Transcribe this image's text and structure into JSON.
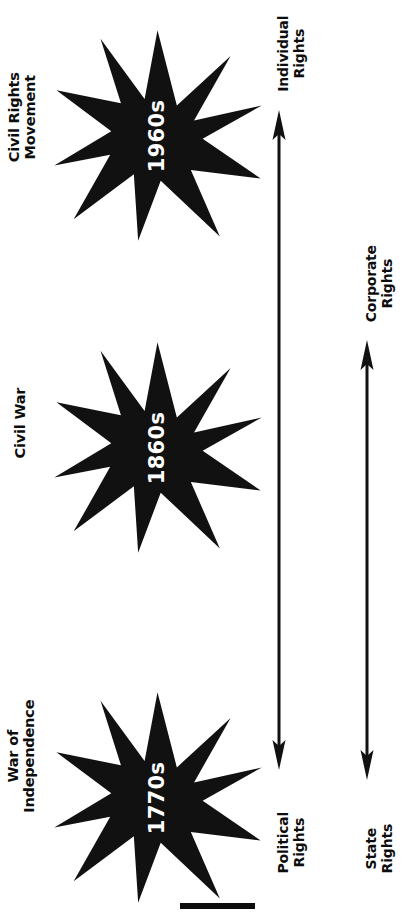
{
  "figure": {
    "type": "timeline-diagram",
    "orientation": "rotated-90-ccw",
    "background_color": "#ffffff",
    "ink_color": "#0d0d0d",
    "star_text_color": "#ffffff"
  },
  "events": [
    {
      "id": "civil-rights-movement",
      "label": "Civil Rights\nMovement",
      "decade": "1960s"
    },
    {
      "id": "civil-war",
      "label": "Civil War",
      "decade": "1860s"
    },
    {
      "id": "war-of-independence",
      "label": "War of\nIndependence",
      "decade": "1770s"
    }
  ],
  "axes": [
    {
      "id": "political-individual",
      "arrow": "double-headed",
      "start_label": "Political\nRights",
      "end_label": "Individual\nRights"
    },
    {
      "id": "state-corporate",
      "arrow": "double-headed",
      "start_label": "State\nRights",
      "end_label": "Corporate\nRights"
    }
  ],
  "decorations": {
    "bottom_rule": "solid-black-bar"
  }
}
